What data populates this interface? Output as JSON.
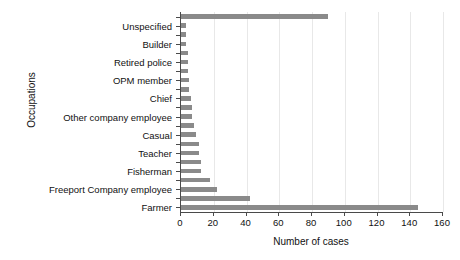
{
  "chart_data": {
    "type": "bar",
    "orientation": "horizontal",
    "title": "",
    "xlabel": "Number of cases",
    "ylabel": "Occupations",
    "xlim": [
      0,
      160
    ],
    "xticks": [
      0,
      20,
      40,
      60,
      80,
      100,
      120,
      140,
      160
    ],
    "grid": "vertical",
    "legend": "none",
    "bar_color": "#8a8a8a",
    "axis_color": "#4a4a4a",
    "grid_color": "#e8e8e8",
    "categories": [
      "Farmer",
      "Freeport Company employee",
      "Fisherman",
      "Teacher",
      "Casual",
      "Other company employee",
      "Chief",
      "OPM member",
      "Retired police",
      "Builder",
      "Unspecified"
    ],
    "values": [
      145,
      60,
      12,
      11,
      8,
      7,
      5,
      4,
      4,
      3,
      90
    ],
    "bars_bottom_to_top": [
      145,
      42,
      22,
      18,
      12,
      12,
      11,
      11,
      9,
      8,
      7,
      7,
      6,
      5,
      5,
      4,
      4,
      4,
      3,
      3,
      3,
      90
    ],
    "note": "Values estimated from axis gridlines; labels shown on alternating tick positions"
  },
  "xticklabels": [
    "0",
    "20",
    "40",
    "60",
    "80",
    "100",
    "120",
    "140",
    "160"
  ]
}
